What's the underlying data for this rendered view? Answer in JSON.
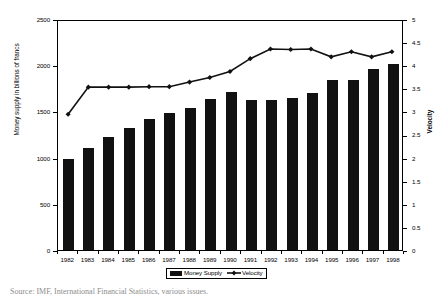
{
  "chart_data": {
    "type": "bar",
    "title": "",
    "xlabel": "",
    "ylabel": "Money supply in billions of francs",
    "y2label": "Velocity",
    "categories": [
      "1982",
      "1983",
      "1984",
      "1985",
      "1986",
      "1987",
      "1988",
      "1989",
      "1990",
      "1991",
      "1992",
      "1993",
      "1994",
      "1995",
      "1996",
      "1997",
      "1998"
    ],
    "ylim": [
      0,
      2500
    ],
    "y2lim": [
      0,
      5
    ],
    "yticks": [
      "0",
      "500",
      "1000",
      "1500",
      "2000",
      "2500"
    ],
    "ytick_values": [
      0,
      500,
      1000,
      1500,
      2000,
      2500
    ],
    "y2ticks": [
      "0",
      "0.5",
      "1",
      "1.5",
      "2",
      "2.5",
      "3",
      "3.5",
      "4",
      "4.5",
      "5"
    ],
    "y2tick_values": [
      0,
      0.5,
      1,
      1.5,
      2,
      2.5,
      3,
      3.5,
      4,
      4.5,
      5
    ],
    "grid": false,
    "legend_position": "bottom-center",
    "series": [
      {
        "name": "Money Supply",
        "kind": "bar",
        "axis": "left",
        "color": "#111111",
        "values": [
          985,
          1105,
          1220,
          1320,
          1420,
          1485,
          1540,
          1635,
          1705,
          1625,
          1625,
          1640,
          1695,
          1835,
          1835,
          1955,
          2015
        ]
      },
      {
        "name": "Velocity",
        "kind": "line",
        "axis": "right",
        "color": "#111111",
        "marker": "diamond",
        "values": [
          2.97,
          3.56,
          3.56,
          3.56,
          3.57,
          3.57,
          3.67,
          3.77,
          3.9,
          4.18,
          4.39,
          4.38,
          4.39,
          4.22,
          4.33,
          4.22,
          4.33
        ]
      }
    ]
  },
  "legend": {
    "items": [
      {
        "label": "Money Supply",
        "swatch": "bar-swatch"
      },
      {
        "label": "Velocity",
        "swatch": "line-marker-swatch"
      }
    ]
  },
  "caption": {
    "text": "Source:  IMF, International Financial Statistics, various issues."
  }
}
